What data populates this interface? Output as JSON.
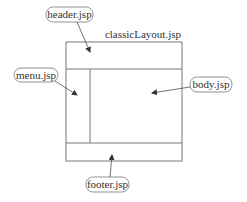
{
  "diagram": {
    "title": "classicLayout.jsp",
    "labels": {
      "header": "header.jsp",
      "menu": "menu.jsp",
      "body": "body.jsp",
      "footer": "footer.jsp"
    },
    "colors": {
      "line": "#555555",
      "text": "#333333",
      "background": "#ffffff"
    }
  }
}
